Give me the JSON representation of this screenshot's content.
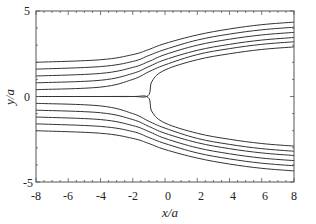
{
  "chart_data": {
    "type": "line",
    "title": "",
    "xlabel": "x/a",
    "ylabel": "y/a",
    "xlim": [
      -8,
      8
    ],
    "ylim": [
      -5,
      5
    ],
    "grid": false,
    "legend": null,
    "x_ticks": [
      -8,
      -6,
      -4,
      -2,
      0,
      2,
      4,
      6,
      8
    ],
    "y_ticks": [
      -5,
      0,
      5
    ],
    "stagnation_point": {
      "x": -1.0,
      "y": 0
    },
    "series": [
      {
        "name": "streamline-1",
        "x": [
          -8,
          -4,
          -2,
          -1,
          0,
          2,
          4,
          6,
          8
        ],
        "y": [
          2.0,
          2.15,
          2.45,
          2.75,
          3.1,
          3.6,
          3.95,
          4.2,
          4.35
        ]
      },
      {
        "name": "streamline-2",
        "x": [
          -8,
          -4,
          -2,
          -1,
          0,
          2,
          4,
          6,
          8
        ],
        "y": [
          1.6,
          1.75,
          2.05,
          2.4,
          2.75,
          3.3,
          3.65,
          3.9,
          4.05
        ]
      },
      {
        "name": "streamline-3",
        "x": [
          -8,
          -4,
          -2,
          -1,
          0,
          2,
          4,
          6,
          8
        ],
        "y": [
          1.2,
          1.35,
          1.7,
          2.05,
          2.45,
          3.0,
          3.35,
          3.6,
          3.75
        ]
      },
      {
        "name": "streamline-4",
        "x": [
          -8,
          -4,
          -2,
          -1,
          0,
          2,
          4,
          6,
          8
        ],
        "y": [
          0.8,
          0.95,
          1.35,
          1.75,
          2.15,
          2.7,
          3.05,
          3.3,
          3.45
        ]
      },
      {
        "name": "streamline-5",
        "x": [
          -8,
          -4,
          -2,
          -1,
          0,
          2,
          4,
          6,
          8
        ],
        "y": [
          0.4,
          0.55,
          1.0,
          1.45,
          1.85,
          2.45,
          2.8,
          3.05,
          3.2
        ]
      },
      {
        "name": "dividing-streamline-upper",
        "x": [
          -8,
          -4,
          -2,
          -1.05,
          -0.8,
          0,
          2,
          4,
          6,
          8
        ],
        "y": [
          0,
          0,
          0,
          0.05,
          0.9,
          1.55,
          2.15,
          2.5,
          2.75,
          2.9
        ]
      },
      {
        "name": "dividing-streamline-lower",
        "x": [
          -8,
          -4,
          -2,
          -1.05,
          -0.8,
          0,
          2,
          4,
          6,
          8
        ],
        "y": [
          0,
          0,
          0,
          -0.05,
          -0.9,
          -1.55,
          -2.15,
          -2.5,
          -2.75,
          -2.9
        ]
      },
      {
        "name": "streamline-6",
        "x": [
          -8,
          -4,
          -2,
          -1,
          0,
          2,
          4,
          6,
          8
        ],
        "y": [
          -0.4,
          -0.55,
          -1.0,
          -1.45,
          -1.85,
          -2.45,
          -2.8,
          -3.05,
          -3.2
        ]
      },
      {
        "name": "streamline-7",
        "x": [
          -8,
          -4,
          -2,
          -1,
          0,
          2,
          4,
          6,
          8
        ],
        "y": [
          -0.8,
          -0.95,
          -1.35,
          -1.75,
          -2.15,
          -2.7,
          -3.05,
          -3.3,
          -3.45
        ]
      },
      {
        "name": "streamline-8",
        "x": [
          -8,
          -4,
          -2,
          -1,
          0,
          2,
          4,
          6,
          8
        ],
        "y": [
          -1.2,
          -1.35,
          -1.7,
          -2.05,
          -2.45,
          -3.0,
          -3.35,
          -3.6,
          -3.75
        ]
      },
      {
        "name": "streamline-9",
        "x": [
          -8,
          -4,
          -2,
          -1,
          0,
          2,
          4,
          6,
          8
        ],
        "y": [
          -1.6,
          -1.75,
          -2.05,
          -2.4,
          -2.75,
          -3.3,
          -3.65,
          -3.9,
          -4.05
        ]
      },
      {
        "name": "streamline-10",
        "x": [
          -8,
          -4,
          -2,
          -1,
          0,
          2,
          4,
          6,
          8
        ],
        "y": [
          -2.0,
          -2.15,
          -2.45,
          -2.75,
          -3.1,
          -3.6,
          -3.95,
          -4.2,
          -4.35
        ]
      }
    ],
    "colors": {
      "line": "#333333",
      "axis": "#555555",
      "text": "#222222",
      "background": "#ffffff"
    }
  },
  "labels": {
    "xlabel": "x/a",
    "ylabel": "y/a",
    "xticks": [
      "-8",
      "-6",
      "-4",
      "-2",
      "0",
      "2",
      "4",
      "6",
      "8"
    ],
    "yticks": [
      "5",
      "0",
      "-5"
    ]
  }
}
